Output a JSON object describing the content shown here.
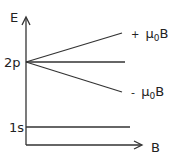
{
  "diagram": {
    "axes": {
      "y_label": "E",
      "x_label": "B"
    },
    "levels": [
      {
        "label": "2p",
        "splits": true
      },
      {
        "label": "1s",
        "splits": false
      }
    ],
    "split_labels": {
      "upper": {
        "sign": "+",
        "mu": "μ",
        "sub": "0",
        "tail": "B"
      },
      "lower": {
        "sign": "-",
        "mu": "μ",
        "sub": "0",
        "tail": "B"
      }
    },
    "colors": {
      "line": "#333333",
      "text": "#222222",
      "background": "#ffffff"
    }
  }
}
